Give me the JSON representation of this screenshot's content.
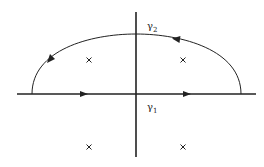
{
  "diagram": {
    "type": "contour-integral",
    "colors": {
      "stroke": "#222222",
      "background": "#ffffff"
    },
    "axes": {
      "real": {
        "x1": 17,
        "x2": 256,
        "y": 94
      },
      "imag": {
        "x": 136,
        "y1": 12,
        "y2": 157
      }
    },
    "contours": [
      {
        "name": "gamma1",
        "label": "γ",
        "sub": "1",
        "label_pos": [
          147,
          103
        ],
        "path": "real axis segment",
        "direction": "right"
      },
      {
        "name": "gamma2",
        "label": "γ",
        "sub": "2",
        "label_pos": [
          147,
          22
        ],
        "path": "upper semicircular arc",
        "direction": "counterclockwise"
      }
    ],
    "arc": {
      "x_left": 32,
      "x_right": 241,
      "y_base": 94,
      "y_top": 34
    },
    "poles": [
      {
        "x": 89,
        "y": 60,
        "symbol": "×"
      },
      {
        "x": 183,
        "y": 60,
        "symbol": "×"
      },
      {
        "x": 89,
        "y": 147,
        "symbol": "×"
      },
      {
        "x": 183,
        "y": 147,
        "symbol": "×"
      }
    ]
  }
}
